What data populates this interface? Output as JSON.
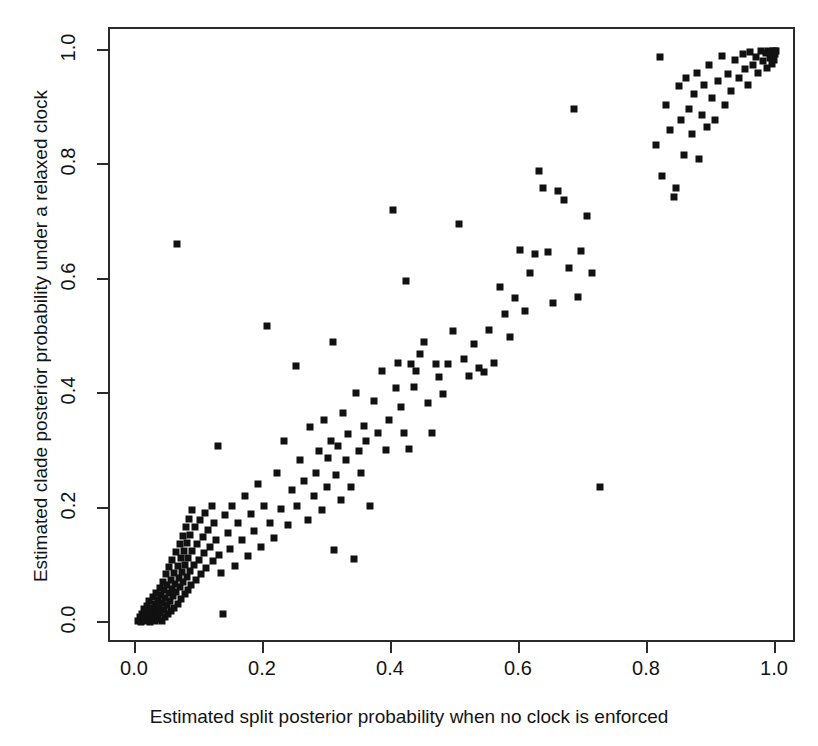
{
  "figure": {
    "title": "",
    "ghost_text": {
      "top": "",
      "mid1": "",
      "mid2": "",
      "bot1": "",
      "bot2": ""
    }
  },
  "axes": {
    "xlabel": "Estimated split posterior probability when no clock is enforced",
    "ylabel": "Estimated clade posterior probability under a relaxed clock",
    "x_ticks": [
      "0.0",
      "0.2",
      "0.4",
      "0.6",
      "0.8",
      "1.0"
    ],
    "y_ticks": [
      "0.0",
      "0.2",
      "0.4",
      "0.6",
      "0.8",
      "1.0"
    ]
  },
  "chart_data": {
    "type": "scatter",
    "title": "",
    "xlabel": "Estimated split posterior probability when no clock is enforced",
    "ylabel": "Estimated clade posterior probability under a relaxed clock",
    "xlim": [
      0.0,
      1.0
    ],
    "ylim": [
      0.0,
      1.0
    ],
    "xticks": [
      0.0,
      0.2,
      0.4,
      0.6,
      0.8,
      1.0
    ],
    "yticks": [
      0.0,
      0.2,
      0.4,
      0.6,
      0.8,
      1.0
    ],
    "grid": false,
    "legend": null,
    "marker": "filled-square",
    "marker_color": "#111111",
    "marker_size_px": 7,
    "n_points": 236,
    "points": [
      [
        0.003,
        0.004
      ],
      [
        0.006,
        0.01
      ],
      [
        0.008,
        0.002
      ],
      [
        0.01,
        0.016
      ],
      [
        0.012,
        0.006
      ],
      [
        0.013,
        0.024
      ],
      [
        0.014,
        0.003
      ],
      [
        0.016,
        0.012
      ],
      [
        0.017,
        0.03
      ],
      [
        0.018,
        0.005
      ],
      [
        0.019,
        0.02
      ],
      [
        0.02,
        0.008
      ],
      [
        0.021,
        0.038
      ],
      [
        0.022,
        0.002
      ],
      [
        0.023,
        0.014
      ],
      [
        0.024,
        0.027
      ],
      [
        0.025,
        0.006
      ],
      [
        0.026,
        0.046
      ],
      [
        0.027,
        0.018
      ],
      [
        0.028,
        0.009
      ],
      [
        0.029,
        0.033
      ],
      [
        0.03,
        0.004
      ],
      [
        0.031,
        0.022
      ],
      [
        0.032,
        0.052
      ],
      [
        0.033,
        0.012
      ],
      [
        0.034,
        0.04
      ],
      [
        0.035,
        0.007
      ],
      [
        0.036,
        0.028
      ],
      [
        0.037,
        0.062
      ],
      [
        0.038,
        0.017
      ],
      [
        0.039,
        0.049
      ],
      [
        0.04,
        0.003
      ],
      [
        0.041,
        0.035
      ],
      [
        0.042,
        0.072
      ],
      [
        0.043,
        0.023
      ],
      [
        0.044,
        0.057
      ],
      [
        0.045,
        0.011
      ],
      [
        0.046,
        0.044
      ],
      [
        0.047,
        0.085
      ],
      [
        0.048,
        0.031
      ],
      [
        0.049,
        0.066
      ],
      [
        0.05,
        0.015
      ],
      [
        0.051,
        0.053
      ],
      [
        0.052,
        0.098
      ],
      [
        0.053,
        0.039
      ],
      [
        0.054,
        0.076
      ],
      [
        0.055,
        0.021
      ],
      [
        0.056,
        0.06
      ],
      [
        0.057,
        0.11
      ],
      [
        0.058,
        0.047
      ],
      [
        0.059,
        0.088
      ],
      [
        0.06,
        0.026
      ],
      [
        0.061,
        0.069
      ],
      [
        0.062,
        0.124
      ],
      [
        0.063,
        0.055
      ],
      [
        0.064,
        0.663
      ],
      [
        0.065,
        0.1
      ],
      [
        0.066,
        0.034
      ],
      [
        0.067,
        0.079
      ],
      [
        0.068,
        0.138
      ],
      [
        0.069,
        0.063
      ],
      [
        0.07,
        0.113
      ],
      [
        0.071,
        0.042
      ],
      [
        0.072,
        0.09
      ],
      [
        0.073,
        0.152
      ],
      [
        0.074,
        0.072
      ],
      [
        0.075,
        0.126
      ],
      [
        0.076,
        0.05
      ],
      [
        0.077,
        0.102
      ],
      [
        0.078,
        0.167
      ],
      [
        0.079,
        0.081
      ],
      [
        0.08,
        0.14
      ],
      [
        0.081,
        0.058
      ],
      [
        0.082,
        0.114
      ],
      [
        0.083,
        0.182
      ],
      [
        0.084,
        0.091
      ],
      [
        0.085,
        0.154
      ],
      [
        0.086,
        0.066
      ],
      [
        0.087,
        0.126
      ],
      [
        0.088,
        0.197
      ],
      [
        0.09,
        0.101
      ],
      [
        0.092,
        0.168
      ],
      [
        0.094,
        0.075
      ],
      [
        0.096,
        0.138
      ],
      [
        0.098,
        0.111
      ],
      [
        0.1,
        0.18
      ],
      [
        0.102,
        0.085
      ],
      [
        0.104,
        0.15
      ],
      [
        0.106,
        0.122
      ],
      [
        0.108,
        0.193
      ],
      [
        0.11,
        0.096
      ],
      [
        0.112,
        0.162
      ],
      [
        0.115,
        0.133
      ],
      [
        0.118,
        0.205
      ],
      [
        0.12,
        0.108
      ],
      [
        0.122,
        0.175
      ],
      [
        0.125,
        0.145
      ],
      [
        0.128,
        0.31
      ],
      [
        0.13,
        0.119
      ],
      [
        0.133,
        0.088
      ],
      [
        0.136,
        0.016
      ],
      [
        0.139,
        0.188
      ],
      [
        0.143,
        0.157
      ],
      [
        0.147,
        0.13
      ],
      [
        0.15,
        0.205
      ],
      [
        0.155,
        0.1
      ],
      [
        0.16,
        0.175
      ],
      [
        0.165,
        0.145
      ],
      [
        0.17,
        0.222
      ],
      [
        0.175,
        0.118
      ],
      [
        0.18,
        0.19
      ],
      [
        0.185,
        0.16
      ],
      [
        0.19,
        0.243
      ],
      [
        0.196,
        0.132
      ],
      [
        0.2,
        0.205
      ],
      [
        0.205,
        0.52
      ],
      [
        0.21,
        0.175
      ],
      [
        0.215,
        0.148
      ],
      [
        0.22,
        0.262
      ],
      [
        0.226,
        0.2
      ],
      [
        0.232,
        0.318
      ],
      [
        0.238,
        0.172
      ],
      [
        0.244,
        0.232
      ],
      [
        0.25,
        0.45
      ],
      [
        0.252,
        0.205
      ],
      [
        0.256,
        0.285
      ],
      [
        0.262,
        0.248
      ],
      [
        0.268,
        0.18
      ],
      [
        0.272,
        0.342
      ],
      [
        0.278,
        0.222
      ],
      [
        0.282,
        0.262
      ],
      [
        0.286,
        0.3
      ],
      [
        0.29,
        0.198
      ],
      [
        0.294,
        0.355
      ],
      [
        0.298,
        0.238
      ],
      [
        0.3,
        0.288
      ],
      [
        0.304,
        0.318
      ],
      [
        0.308,
        0.492
      ],
      [
        0.31,
        0.128
      ],
      [
        0.312,
        0.258
      ],
      [
        0.316,
        0.31
      ],
      [
        0.32,
        0.215
      ],
      [
        0.324,
        0.368
      ],
      [
        0.328,
        0.285
      ],
      [
        0.332,
        0.33
      ],
      [
        0.336,
        0.238
      ],
      [
        0.34,
        0.112
      ],
      [
        0.344,
        0.402
      ],
      [
        0.348,
        0.3
      ],
      [
        0.352,
        0.262
      ],
      [
        0.356,
        0.345
      ],
      [
        0.36,
        0.318
      ],
      [
        0.366,
        0.205
      ],
      [
        0.372,
        0.388
      ],
      [
        0.378,
        0.332
      ],
      [
        0.384,
        0.44
      ],
      [
        0.39,
        0.302
      ],
      [
        0.396,
        0.355
      ],
      [
        0.402,
        0.722
      ],
      [
        0.406,
        0.41
      ],
      [
        0.41,
        0.455
      ],
      [
        0.414,
        0.378
      ],
      [
        0.418,
        0.332
      ],
      [
        0.422,
        0.598
      ],
      [
        0.426,
        0.305
      ],
      [
        0.43,
        0.452
      ],
      [
        0.434,
        0.412
      ],
      [
        0.438,
        0.44
      ],
      [
        0.444,
        0.47
      ],
      [
        0.45,
        0.492
      ],
      [
        0.456,
        0.385
      ],
      [
        0.462,
        0.332
      ],
      [
        0.468,
        0.452
      ],
      [
        0.474,
        0.43
      ],
      [
        0.48,
        0.4
      ],
      [
        0.488,
        0.452
      ],
      [
        0.496,
        0.51
      ],
      [
        0.504,
        0.697
      ],
      [
        0.512,
        0.462
      ],
      [
        0.52,
        0.432
      ],
      [
        0.528,
        0.488
      ],
      [
        0.536,
        0.445
      ],
      [
        0.544,
        0.438
      ],
      [
        0.552,
        0.512
      ],
      [
        0.56,
        0.455
      ],
      [
        0.568,
        0.588
      ],
      [
        0.576,
        0.54
      ],
      [
        0.584,
        0.5
      ],
      [
        0.592,
        0.568
      ],
      [
        0.6,
        0.652
      ],
      [
        0.608,
        0.545
      ],
      [
        0.616,
        0.612
      ],
      [
        0.624,
        0.645
      ],
      [
        0.63,
        0.79
      ],
      [
        0.636,
        0.76
      ],
      [
        0.644,
        0.648
      ],
      [
        0.652,
        0.56
      ],
      [
        0.66,
        0.755
      ],
      [
        0.668,
        0.74
      ],
      [
        0.676,
        0.62
      ],
      [
        0.684,
        0.898
      ],
      [
        0.69,
        0.57
      ],
      [
        0.696,
        0.65
      ],
      [
        0.704,
        0.712
      ],
      [
        0.712,
        0.612
      ],
      [
        0.725,
        0.238
      ],
      [
        0.812,
        0.835
      ],
      [
        0.818,
        0.99
      ],
      [
        0.822,
        0.782
      ],
      [
        0.828,
        0.905
      ],
      [
        0.834,
        0.862
      ],
      [
        0.84,
        0.745
      ],
      [
        0.843,
        0.76
      ],
      [
        0.848,
        0.938
      ],
      [
        0.852,
        0.88
      ],
      [
        0.856,
        0.818
      ],
      [
        0.86,
        0.952
      ],
      [
        0.864,
        0.898
      ],
      [
        0.868,
        0.855
      ],
      [
        0.872,
        0.925
      ],
      [
        0.876,
        0.962
      ],
      [
        0.88,
        0.812
      ],
      [
        0.884,
        0.888
      ],
      [
        0.888,
        0.94
      ],
      [
        0.892,
        0.868
      ],
      [
        0.896,
        0.975
      ],
      [
        0.9,
        0.918
      ],
      [
        0.905,
        0.88
      ],
      [
        0.91,
        0.948
      ],
      [
        0.915,
        0.992
      ],
      [
        0.92,
        0.905
      ],
      [
        0.925,
        0.96
      ],
      [
        0.93,
        0.93
      ],
      [
        0.936,
        0.985
      ],
      [
        0.942,
        0.952
      ],
      [
        0.948,
        0.995
      ],
      [
        0.952,
        0.968
      ],
      [
        0.956,
        0.94
      ],
      [
        0.96,
        0.998
      ],
      [
        0.964,
        0.975
      ],
      [
        0.968,
        0.99
      ],
      [
        0.972,
        0.962
      ],
      [
        0.976,
        1.0
      ],
      [
        0.98,
        0.982
      ],
      [
        0.984,
        0.996
      ],
      [
        0.986,
        0.97
      ],
      [
        0.988,
        1.0
      ],
      [
        0.99,
        0.988
      ],
      [
        0.992,
        0.998
      ],
      [
        0.994,
        0.978
      ],
      [
        0.995,
        1.0
      ],
      [
        0.996,
        0.992
      ],
      [
        0.997,
        0.985
      ],
      [
        0.998,
        1.0
      ],
      [
        0.999,
        0.995
      ],
      [
        1.0,
        1.0
      ]
    ]
  }
}
